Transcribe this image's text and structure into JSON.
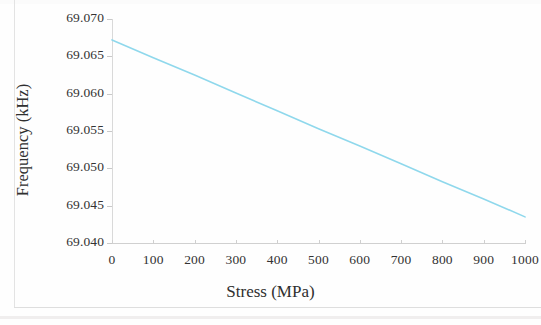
{
  "chart_data": {
    "type": "line",
    "title": "",
    "subtitle": "",
    "xlabel": "Stress (MPa)",
    "ylabel": "Frequency (kHz)",
    "xlim": [
      0,
      1000
    ],
    "ylim": [
      69.04,
      69.07
    ],
    "xticks": [
      0,
      100,
      200,
      300,
      400,
      500,
      600,
      700,
      800,
      900,
      1000
    ],
    "xtick_labels": [
      "0",
      "100",
      "200",
      "300",
      "400",
      "500",
      "600",
      "700",
      "800",
      "900",
      "1000"
    ],
    "yticks": [
      69.04,
      69.045,
      69.05,
      69.055,
      69.06,
      69.065,
      69.07
    ],
    "ytick_labels": [
      "69.040",
      "69.045",
      "69.050",
      "69.055",
      "69.060",
      "69.065",
      "69.070"
    ],
    "grid": false,
    "legend": null,
    "legend_position": "none",
    "line_color": "#8fd8ec",
    "line_width_px": 1.6,
    "series": [
      {
        "name": "Frequency vs Stress",
        "x": [
          0,
          100,
          200,
          300,
          400,
          500,
          600,
          700,
          800,
          900,
          1000
        ],
        "values": [
          69.0672,
          69.0648,
          69.0625,
          69.0601,
          69.0577,
          69.0553,
          69.053,
          69.0506,
          69.0482,
          69.0459,
          69.0435
        ]
      }
    ],
    "annotations": []
  },
  "figure": {
    "background_color": "#ffffff",
    "axis_color": "#d4d4d4",
    "text_color": "#333333"
  }
}
